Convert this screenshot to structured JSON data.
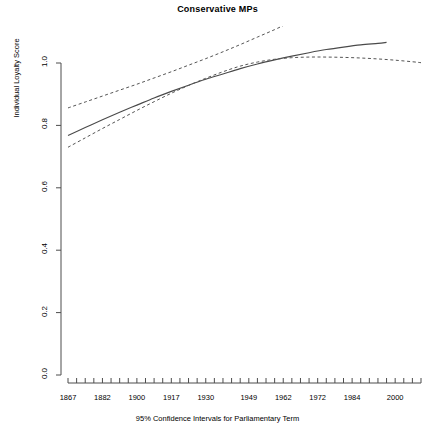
{
  "chart_data": {
    "type": "line",
    "title": "Conservative MPs",
    "xlabel": "95% Confidence Intervals for Parliamentary Term",
    "ylabel": "Individual Loyalty Score",
    "ylim": [
      0.0,
      1.1
    ],
    "xlim": [
      0,
      41
    ],
    "grid": false,
    "legend": "none",
    "ytick_labels": [
      "0.0",
      "0.2",
      "0.4",
      "0.6",
      "0.8",
      "1.0"
    ],
    "ytick_values": [
      0.0,
      0.2,
      0.4,
      0.6,
      0.8,
      1.0
    ],
    "xtick_count": 42,
    "xtick_labels": [
      "1867",
      "1882",
      "1900",
      "1917",
      "1930",
      "1949",
      "1962",
      "1972",
      "1984",
      "2000"
    ],
    "xtick_label_indices": [
      0,
      4,
      8,
      12,
      16,
      21,
      25,
      29,
      33,
      38
    ],
    "series": [
      {
        "name": "Fitted loyalty score",
        "style": "solid",
        "x": [
          0,
          2,
          4,
          6,
          8,
          10,
          12,
          14,
          16,
          18,
          20,
          22,
          24,
          26,
          28,
          30,
          32,
          34,
          36,
          37
        ],
        "values": [
          0.768,
          0.793,
          0.818,
          0.842,
          0.865,
          0.888,
          0.909,
          0.929,
          0.948,
          0.965,
          0.982,
          0.997,
          1.01,
          1.022,
          1.033,
          1.043,
          1.051,
          1.058,
          1.063,
          1.066
        ]
      },
      {
        "name": "Upper 95% confidence bound",
        "style": "dashed",
        "x": [
          0,
          2,
          4,
          6,
          8,
          10,
          12,
          14,
          16,
          18,
          20,
          22,
          24,
          26,
          28
        ],
        "values": [
          0.856,
          0.875,
          0.894,
          0.913,
          0.932,
          0.952,
          0.972,
          0.993,
          1.014,
          1.036,
          1.059,
          1.083,
          1.107,
          1.133,
          1.16
        ]
      },
      {
        "name": "Lower 95% confidence bound",
        "style": "dashed",
        "x": [
          0,
          2,
          4,
          6,
          8,
          10,
          12,
          14,
          16,
          18,
          20,
          22,
          24,
          26,
          28,
          30,
          32,
          34,
          36,
          38,
          40,
          41
        ],
        "values": [
          0.73,
          0.76,
          0.79,
          0.819,
          0.848,
          0.876,
          0.903,
          0.928,
          0.951,
          0.972,
          0.99,
          1.003,
          1.012,
          1.017,
          1.019,
          1.019,
          1.018,
          1.016,
          1.013,
          1.009,
          1.004,
          1.001
        ]
      }
    ]
  }
}
